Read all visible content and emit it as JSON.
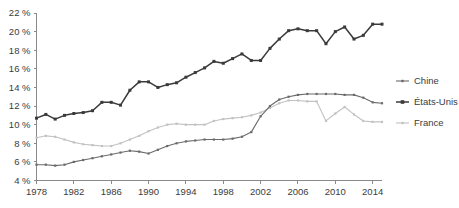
{
  "chart_data": {
    "type": "line",
    "title": "",
    "subtitle": "",
    "xlabel": "",
    "ylabel": "",
    "xlim": [
      1978,
      2015
    ],
    "ylim": [
      4,
      22
    ],
    "y_tick_labels": [
      "4 %",
      "6 %",
      "8 %",
      "10 %",
      "12 %",
      "14 %",
      "16 %",
      "18 %",
      "20 %",
      "22 %"
    ],
    "y_ticks": [
      4,
      6,
      8,
      10,
      12,
      14,
      16,
      18,
      20,
      22
    ],
    "x_tick_labels": [
      "1978",
      "1982",
      "1986",
      "1990",
      "1994",
      "1998",
      "2002",
      "2006",
      "2010",
      "2014"
    ],
    "x_ticks": [
      1978,
      1982,
      1986,
      1990,
      1994,
      1998,
      2002,
      2006,
      2010,
      2014
    ],
    "grid": false,
    "legend_position": "right",
    "x": [
      1978,
      1979,
      1980,
      1981,
      1982,
      1983,
      1984,
      1985,
      1986,
      1987,
      1988,
      1989,
      1990,
      1991,
      1992,
      1993,
      1994,
      1995,
      1996,
      1997,
      1998,
      1999,
      2000,
      2001,
      2002,
      2003,
      2004,
      2005,
      2006,
      2007,
      2008,
      2009,
      2010,
      2011,
      2012,
      2013,
      2014,
      2015
    ],
    "series": [
      {
        "name": "Chine",
        "color": "#6b6b6b",
        "marker": "small-square",
        "values": [
          5.7,
          5.7,
          5.6,
          5.7,
          6.0,
          6.2,
          6.4,
          6.6,
          6.8,
          7.0,
          7.2,
          7.1,
          6.9,
          7.3,
          7.7,
          8.0,
          8.2,
          8.3,
          8.4,
          8.4,
          8.4,
          8.5,
          8.7,
          9.2,
          10.9,
          12.0,
          12.7,
          13.0,
          13.2,
          13.3,
          13.3,
          13.3,
          13.3,
          13.2,
          13.2,
          12.9,
          12.4,
          12.3
        ]
      },
      {
        "name": "États-Unis",
        "color": "#3a3a3a",
        "marker": "square",
        "values": [
          10.7,
          11.1,
          10.6,
          11.0,
          11.2,
          11.3,
          11.5,
          12.4,
          12.4,
          12.1,
          13.7,
          14.6,
          14.6,
          14.0,
          14.3,
          14.5,
          15.1,
          15.6,
          16.1,
          16.8,
          16.6,
          17.1,
          17.6,
          16.9,
          16.9,
          18.2,
          19.2,
          20.1,
          20.3,
          20.1,
          20.1,
          18.7,
          20.0,
          20.5,
          19.2,
          19.6,
          20.8,
          20.8
        ]
      },
      {
        "name": "France",
        "color": "#c2c2c2",
        "marker": "small-square",
        "values": [
          8.6,
          8.8,
          8.7,
          8.4,
          8.1,
          7.9,
          7.8,
          7.7,
          7.7,
          8.0,
          8.4,
          8.8,
          9.3,
          9.7,
          10.0,
          10.1,
          10.0,
          10.0,
          10.0,
          10.4,
          10.6,
          10.7,
          10.8,
          11.0,
          11.3,
          11.8,
          12.3,
          12.6,
          12.6,
          12.5,
          12.5,
          10.4,
          11.2,
          11.9,
          11.1,
          10.4,
          10.3,
          10.3
        ]
      }
    ]
  },
  "legend": {
    "items": [
      {
        "label": "Chine",
        "color": "#6b6b6b"
      },
      {
        "label": "États-Unis",
        "color": "#3a3a3a"
      },
      {
        "label": "France",
        "color": "#c2c2c2"
      }
    ]
  },
  "axis": {
    "line_color": "#8a8a8a"
  }
}
